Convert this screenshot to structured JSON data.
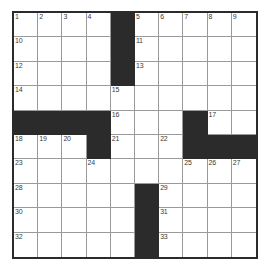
{
  "puzzle": {
    "type": "crossword-grid",
    "title": "",
    "rows": 9,
    "cols": 10,
    "colors": {
      "block": "#2b2b2b",
      "cell": "#ffffff",
      "gridline": "#9a9a9a",
      "border": "#2b2b2b",
      "number": "#3a3a3a"
    },
    "legend": {
      "white_cell": "open-letter-square",
      "black_cell": "blocked-square"
    },
    "cells": [
      [
        {
          "block": false,
          "num": "1"
        },
        {
          "block": false,
          "num": "2"
        },
        {
          "block": false,
          "num": "3"
        },
        {
          "block": false,
          "num": "4"
        },
        {
          "block": true,
          "num": ""
        },
        {
          "block": false,
          "num": "5"
        },
        {
          "block": false,
          "num": "6"
        },
        {
          "block": false,
          "num": "7"
        },
        {
          "block": false,
          "num": "8"
        },
        {
          "block": false,
          "num": "9"
        }
      ],
      [
        {
          "block": false,
          "num": "10"
        },
        {
          "block": false,
          "num": ""
        },
        {
          "block": false,
          "num": ""
        },
        {
          "block": false,
          "num": ""
        },
        {
          "block": true,
          "num": ""
        },
        {
          "block": false,
          "num": "11"
        },
        {
          "block": false,
          "num": ""
        },
        {
          "block": false,
          "num": ""
        },
        {
          "block": false,
          "num": ""
        },
        {
          "block": false,
          "num": ""
        }
      ],
      [
        {
          "block": false,
          "num": "12"
        },
        {
          "block": false,
          "num": ""
        },
        {
          "block": false,
          "num": ""
        },
        {
          "block": false,
          "num": ""
        },
        {
          "block": true,
          "num": ""
        },
        {
          "block": false,
          "num": "13"
        },
        {
          "block": false,
          "num": ""
        },
        {
          "block": false,
          "num": ""
        },
        {
          "block": false,
          "num": ""
        },
        {
          "block": false,
          "num": ""
        }
      ],
      [
        {
          "block": false,
          "num": "14"
        },
        {
          "block": false,
          "num": ""
        },
        {
          "block": false,
          "num": ""
        },
        {
          "block": false,
          "num": ""
        },
        {
          "block": false,
          "num": "15"
        },
        {
          "block": false,
          "num": ""
        },
        {
          "block": false,
          "num": ""
        },
        {
          "block": false,
          "num": ""
        },
        {
          "block": false,
          "num": ""
        },
        {
          "block": false,
          "num": ""
        }
      ],
      [
        {
          "block": true,
          "num": ""
        },
        {
          "block": true,
          "num": ""
        },
        {
          "block": true,
          "num": ""
        },
        {
          "block": true,
          "num": ""
        },
        {
          "block": false,
          "num": "16"
        },
        {
          "block": false,
          "num": ""
        },
        {
          "block": false,
          "num": ""
        },
        {
          "block": true,
          "num": ""
        },
        {
          "block": false,
          "num": "17"
        },
        {
          "block": false,
          "num": ""
        }
      ],
      [
        {
          "block": false,
          "num": "18"
        },
        {
          "block": false,
          "num": "19"
        },
        {
          "block": false,
          "num": "20"
        },
        {
          "block": true,
          "num": ""
        },
        {
          "block": false,
          "num": "21"
        },
        {
          "block": false,
          "num": ""
        },
        {
          "block": false,
          "num": "22"
        },
        {
          "block": true,
          "num": ""
        },
        {
          "block": true,
          "num": ""
        },
        {
          "block": true,
          "num": ""
        }
      ],
      [
        {
          "block": false,
          "num": "23"
        },
        {
          "block": false,
          "num": ""
        },
        {
          "block": false,
          "num": ""
        },
        {
          "block": false,
          "num": "24"
        },
        {
          "block": false,
          "num": ""
        },
        {
          "block": false,
          "num": ""
        },
        {
          "block": false,
          "num": ""
        },
        {
          "block": false,
          "num": "25"
        },
        {
          "block": false,
          "num": "26"
        },
        {
          "block": false,
          "num": "27"
        }
      ],
      [
        {
          "block": false,
          "num": "28"
        },
        {
          "block": false,
          "num": ""
        },
        {
          "block": false,
          "num": ""
        },
        {
          "block": false,
          "num": ""
        },
        {
          "block": false,
          "num": ""
        },
        {
          "block": true,
          "num": ""
        },
        {
          "block": false,
          "num": "29"
        },
        {
          "block": false,
          "num": ""
        },
        {
          "block": false,
          "num": ""
        },
        {
          "block": false,
          "num": ""
        }
      ],
      [
        {
          "block": false,
          "num": "30"
        },
        {
          "block": false,
          "num": ""
        },
        {
          "block": false,
          "num": ""
        },
        {
          "block": false,
          "num": ""
        },
        {
          "block": false,
          "num": ""
        },
        {
          "block": true,
          "num": ""
        },
        {
          "block": false,
          "num": "31"
        },
        {
          "block": false,
          "num": ""
        },
        {
          "block": false,
          "num": ""
        },
        {
          "block": false,
          "num": ""
        }
      ],
      [
        {
          "block": false,
          "num": "32"
        },
        {
          "block": false,
          "num": ""
        },
        {
          "block": false,
          "num": ""
        },
        {
          "block": false,
          "num": ""
        },
        {
          "block": false,
          "num": ""
        },
        {
          "block": true,
          "num": ""
        },
        {
          "block": false,
          "num": "33"
        },
        {
          "block": false,
          "num": ""
        },
        {
          "block": false,
          "num": ""
        },
        {
          "block": false,
          "num": ""
        }
      ]
    ]
  }
}
